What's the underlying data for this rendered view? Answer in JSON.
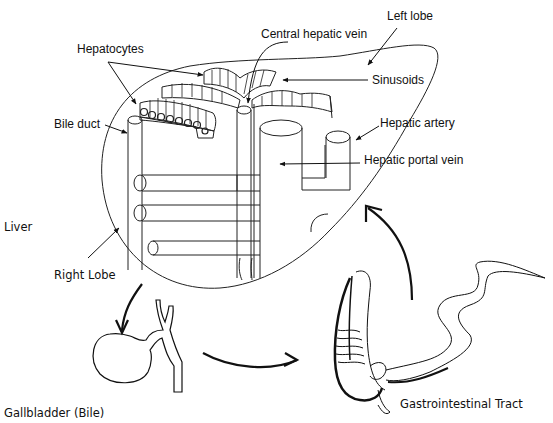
{
  "diagram": {
    "labels": {
      "left_lobe": "Left lobe",
      "central_hepatic_vein": "Central hepatic vein",
      "hepatocytes": "Hepatocytes",
      "sinusoids": "Sinusoids",
      "bile_duct": "Bile duct",
      "hepatic_artery": "Hepatic artery",
      "hepatic_portal_vein": "Hepatic portal vein",
      "liver": "Liver",
      "right_lobe": "Right Lobe",
      "gallbladder": "Gallbladder (Bile)",
      "gi_tract": "Gastrointestinal Tract"
    },
    "flow": [
      "Liver",
      "Gallbladder (Bile)",
      "Gastrointestinal Tract",
      "Liver"
    ],
    "colors": {
      "stroke": "#111111",
      "background": "#ffffff"
    }
  }
}
